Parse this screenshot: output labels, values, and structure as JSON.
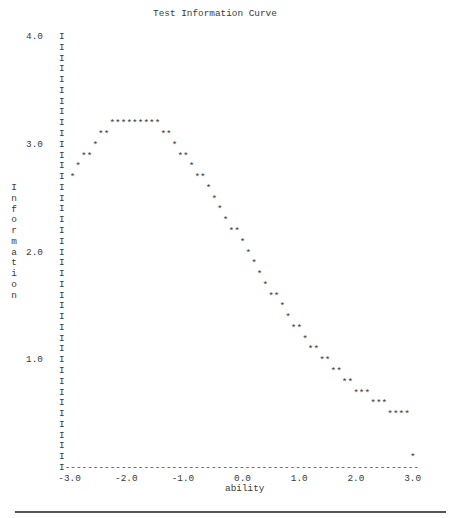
{
  "chart_data": {
    "type": "line",
    "title": "Test Information Curve",
    "xlabel": "ability",
    "ylabel": "Information",
    "xlim": [
      -3.0,
      3.0
    ],
    "ylim": [
      0.0,
      4.0
    ],
    "x_ticks": [
      "-3.0",
      "-2.0",
      "-1.0",
      "0.0",
      "1.0",
      "2.0",
      "3.0"
    ],
    "y_ticks": [
      "4.0",
      "3.0",
      "2.0",
      "1.0"
    ],
    "grid": false,
    "legend": null,
    "marker": "*",
    "axis_char": "I",
    "points": [
      {
        "x": -3.0,
        "y": 2.7
      },
      {
        "x": -2.9,
        "y": 2.8
      },
      {
        "x": -2.8,
        "y": 2.9
      },
      {
        "x": -2.7,
        "y": 2.9
      },
      {
        "x": -2.6,
        "y": 3.0
      },
      {
        "x": -2.5,
        "y": 3.1
      },
      {
        "x": -2.4,
        "y": 3.1
      },
      {
        "x": -2.3,
        "y": 3.2
      },
      {
        "x": -2.2,
        "y": 3.2
      },
      {
        "x": -2.1,
        "y": 3.2
      },
      {
        "x": -2.0,
        "y": 3.2
      },
      {
        "x": -1.9,
        "y": 3.2
      },
      {
        "x": -1.8,
        "y": 3.2
      },
      {
        "x": -1.7,
        "y": 3.2
      },
      {
        "x": -1.6,
        "y": 3.2
      },
      {
        "x": -1.5,
        "y": 3.2
      },
      {
        "x": -1.4,
        "y": 3.1
      },
      {
        "x": -1.3,
        "y": 3.1
      },
      {
        "x": -1.2,
        "y": 3.0
      },
      {
        "x": -1.1,
        "y": 2.9
      },
      {
        "x": -1.0,
        "y": 2.9
      },
      {
        "x": -0.9,
        "y": 2.8
      },
      {
        "x": -0.8,
        "y": 2.7
      },
      {
        "x": -0.7,
        "y": 2.7
      },
      {
        "x": -0.6,
        "y": 2.6
      },
      {
        "x": -0.5,
        "y": 2.5
      },
      {
        "x": -0.4,
        "y": 2.4
      },
      {
        "x": -0.3,
        "y": 2.3
      },
      {
        "x": -0.2,
        "y": 2.2
      },
      {
        "x": -0.1,
        "y": 2.2
      },
      {
        "x": 0.0,
        "y": 2.1
      },
      {
        "x": 0.1,
        "y": 2.0
      },
      {
        "x": 0.2,
        "y": 1.9
      },
      {
        "x": 0.3,
        "y": 1.8
      },
      {
        "x": 0.4,
        "y": 1.7
      },
      {
        "x": 0.5,
        "y": 1.6
      },
      {
        "x": 0.6,
        "y": 1.6
      },
      {
        "x": 0.7,
        "y": 1.5
      },
      {
        "x": 0.8,
        "y": 1.4
      },
      {
        "x": 0.9,
        "y": 1.3
      },
      {
        "x": 1.0,
        "y": 1.3
      },
      {
        "x": 1.1,
        "y": 1.2
      },
      {
        "x": 1.2,
        "y": 1.1
      },
      {
        "x": 1.3,
        "y": 1.1
      },
      {
        "x": 1.4,
        "y": 1.0
      },
      {
        "x": 1.5,
        "y": 1.0
      },
      {
        "x": 1.6,
        "y": 0.9
      },
      {
        "x": 1.7,
        "y": 0.9
      },
      {
        "x": 1.8,
        "y": 0.8
      },
      {
        "x": 1.9,
        "y": 0.8
      },
      {
        "x": 2.0,
        "y": 0.7
      },
      {
        "x": 2.1,
        "y": 0.7
      },
      {
        "x": 2.2,
        "y": 0.7
      },
      {
        "x": 2.3,
        "y": 0.6
      },
      {
        "x": 2.4,
        "y": 0.6
      },
      {
        "x": 2.5,
        "y": 0.6
      },
      {
        "x": 2.6,
        "y": 0.5
      },
      {
        "x": 2.7,
        "y": 0.5
      },
      {
        "x": 2.8,
        "y": 0.5
      },
      {
        "x": 2.9,
        "y": 0.5
      },
      {
        "x": 3.0,
        "y": 0.1
      }
    ]
  },
  "labels": {
    "title": "Test Information Curve",
    "xlabel": "ability",
    "ylabel": "Information"
  }
}
